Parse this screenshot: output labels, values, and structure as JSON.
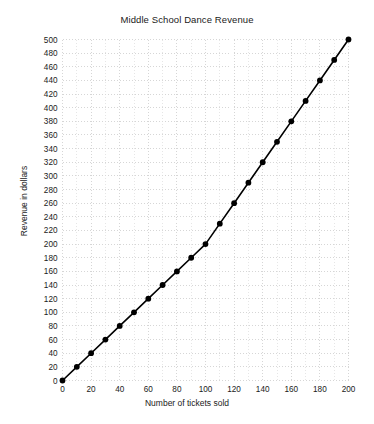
{
  "chart_data": {
    "type": "line",
    "title": "Middle School Dance Revenue",
    "xlabel": "Number of tickets sold",
    "ylabel": "Revenue in dollars",
    "xlim": [
      0,
      200
    ],
    "ylim": [
      0,
      500
    ],
    "grid": true,
    "legend": null,
    "marker": "circle",
    "line_color": "#000000",
    "marker_color": "#000000",
    "grid_color": "#cccccc",
    "xticks": [
      0,
      20,
      40,
      60,
      80,
      100,
      120,
      140,
      160,
      180,
      200
    ],
    "xtick_labels": [
      "0",
      "20",
      "40",
      "60",
      "80",
      "100",
      "120",
      "140",
      "160",
      "180",
      "200"
    ],
    "yticks": [
      0,
      20,
      40,
      60,
      80,
      100,
      120,
      140,
      160,
      180,
      200,
      220,
      240,
      260,
      280,
      300,
      320,
      340,
      360,
      380,
      400,
      420,
      440,
      460,
      480,
      500
    ],
    "ytick_labels": [
      "0",
      "20",
      "40",
      "60",
      "80",
      "100",
      "120",
      "140",
      "160",
      "180",
      "200",
      "220",
      "240",
      "260",
      "280",
      "300",
      "320",
      "340",
      "360",
      "380",
      "400",
      "420",
      "440",
      "460",
      "480",
      "500"
    ],
    "x": [
      0,
      10,
      20,
      30,
      40,
      50,
      60,
      70,
      80,
      90,
      100,
      110,
      120,
      130,
      140,
      150,
      160,
      170,
      180,
      190,
      200
    ],
    "values": [
      0,
      20,
      40,
      60,
      80,
      100,
      120,
      140,
      160,
      180,
      200,
      230,
      260,
      290,
      320,
      350,
      380,
      410,
      440,
      470,
      500
    ],
    "series": [
      {
        "name": "Revenue",
        "x": [
          0,
          10,
          20,
          30,
          40,
          50,
          60,
          70,
          80,
          90,
          100,
          110,
          120,
          130,
          140,
          150,
          160,
          170,
          180,
          190,
          200
        ],
        "values": [
          0,
          20,
          40,
          60,
          80,
          100,
          120,
          140,
          160,
          180,
          200,
          230,
          260,
          290,
          320,
          350,
          380,
          410,
          440,
          470,
          500
        ]
      }
    ]
  }
}
